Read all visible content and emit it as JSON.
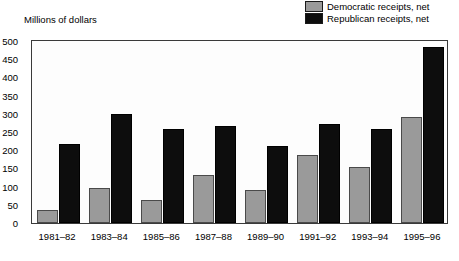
{
  "axis_title": "Millions of dollars",
  "legend": {
    "position": "top-right",
    "items": [
      {
        "label": "Democratic receipts, net",
        "color": "#9a9a9a",
        "swatch_name": "legend-swatch-democratic"
      },
      {
        "label": "Republican receipts, net",
        "color": "#0d0d0d",
        "swatch_name": "legend-swatch-republican"
      }
    ]
  },
  "chart_data": {
    "type": "bar",
    "title": "",
    "subtitle": "",
    "xlabel": "",
    "ylabel": "Millions of dollars",
    "categories": [
      "1981–82",
      "1983–84",
      "1985–86",
      "1987–88",
      "1989–90",
      "1991–92",
      "1993–94",
      "1995–96"
    ],
    "series": [
      {
        "name": "Democratic receipts, net",
        "color": "#9a9a9a",
        "values": [
          35,
          97,
          63,
          132,
          91,
          186,
          153,
          290
        ]
      },
      {
        "name": "Republican receipts, net",
        "color": "#0d0d0d",
        "values": [
          217,
          300,
          257,
          267,
          212,
          273,
          259,
          483
        ]
      }
    ],
    "ylim": [
      0,
      500
    ],
    "ytick_values": [
      0,
      50,
      100,
      150,
      200,
      250,
      300,
      350,
      400,
      450,
      500
    ],
    "ytick_labels": [
      "0",
      "50",
      "100",
      "150",
      "200",
      "250",
      "300",
      "350",
      "400",
      "450",
      "500"
    ],
    "grid": false,
    "legend_position": "top-right"
  }
}
